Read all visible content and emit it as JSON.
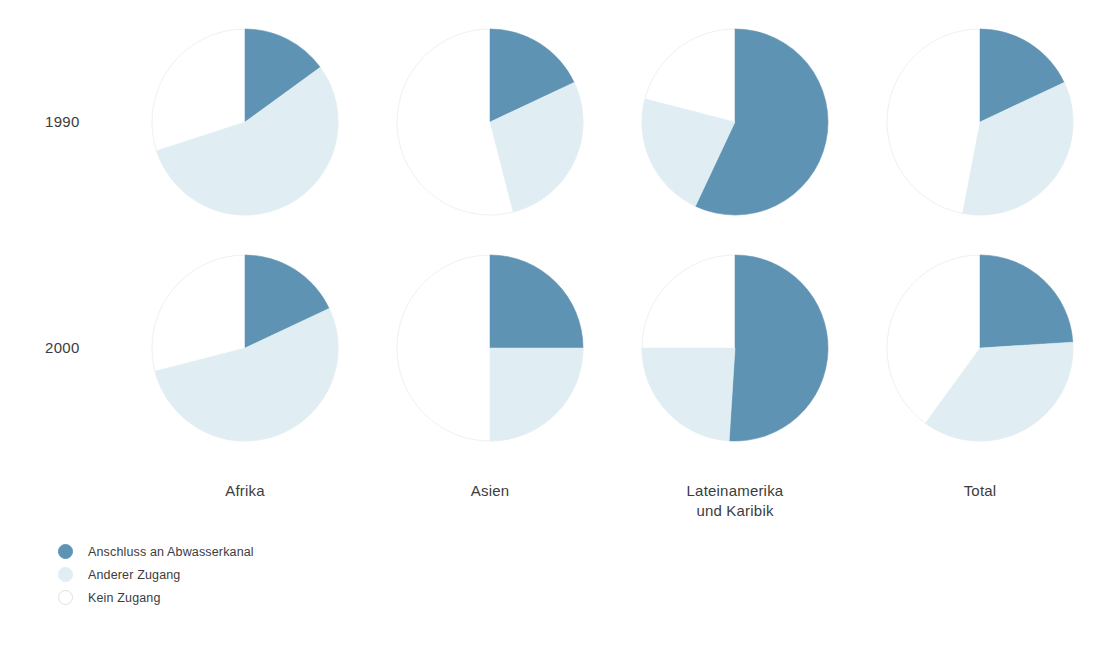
{
  "chart_data": {
    "type": "pie",
    "title": "",
    "subtitle": "",
    "xlabel": "",
    "ylabel": "",
    "layout": "matrix 2 rows x 4 columns of pie charts",
    "grid": false,
    "legend_position": "bottom-left",
    "units": "percent of population",
    "row_labels": [
      "1990",
      "2000"
    ],
    "categories": [
      "Afrika",
      "Asien",
      "Lateinamerika\nund Karibik",
      "Total"
    ],
    "slice_labels": [
      "Anschluss an Abwasserkanal",
      "Anderer Zugang",
      "Kein Zugang"
    ],
    "slice_colors": [
      "#5f93b4",
      "#e0eef3",
      "#ffffff"
    ],
    "series": [
      {
        "name": "1990",
        "pies": [
          {
            "category": "Afrika",
            "values": [
              15,
              55,
              30
            ]
          },
          {
            "category": "Asien",
            "values": [
              18,
              28,
              54
            ]
          },
          {
            "category": "Lateinamerika und Karibik",
            "values": [
              57,
              22,
              21
            ]
          },
          {
            "category": "Total",
            "values": [
              18,
              35,
              47
            ]
          }
        ]
      },
      {
        "name": "2000",
        "pies": [
          {
            "category": "Afrika",
            "values": [
              18,
              53,
              29
            ]
          },
          {
            "category": "Asien",
            "values": [
              25,
              25,
              50
            ]
          },
          {
            "category": "Lateinamerika und Karibik",
            "values": [
              51,
              24,
              25
            ]
          },
          {
            "category": "Total",
            "values": [
              24,
              36,
              40
            ]
          }
        ]
      }
    ]
  },
  "legend": {
    "items": [
      {
        "label": "Anschluss an Abwasserkanal",
        "color": "#5f93b4",
        "outline": "#5f93b4"
      },
      {
        "label": "Anderer Zugang",
        "color": "#e0eef3",
        "outline": "#e0eef3"
      },
      {
        "label": "Kein Zugang",
        "color": "#ffffff",
        "outline": "#e0e0e0"
      }
    ]
  },
  "style": {
    "pie_outline": "#f0f0f0",
    "radius": 93,
    "centers_x": [
      245,
      490,
      735,
      980
    ],
    "centers_y": [
      122,
      348
    ]
  }
}
